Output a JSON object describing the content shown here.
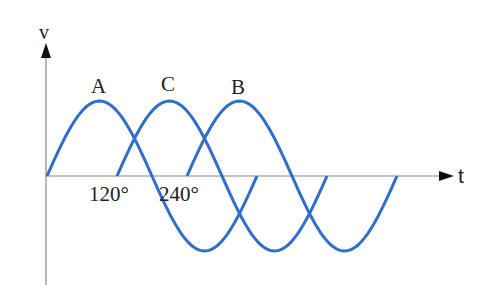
{
  "diagram": {
    "axes": {
      "y_label": "v",
      "x_label": "t"
    },
    "phase_labels": {
      "a": "A",
      "c": "C",
      "b": "B"
    },
    "angle_ticks": {
      "t120": "120°",
      "t240": "240°"
    },
    "colors": {
      "curve": "#2f6fc8",
      "axis": "#888888",
      "arrow": "#111111"
    },
    "waves": [
      {
        "name": "A",
        "phase_shift_deg": 0
      },
      {
        "name": "C",
        "phase_shift_deg": 120
      },
      {
        "name": "B",
        "phase_shift_deg": 240
      }
    ]
  }
}
